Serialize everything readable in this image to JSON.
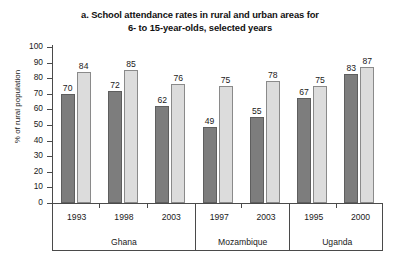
{
  "chart_data": {
    "type": "bar",
    "title": "a. School attendance rates in rural and urban areas for 6- to 15-year-olds, selected years",
    "title_lines": [
      "a. School attendance rates in rural and urban areas for",
      "6- to 15-year-olds, selected years"
    ],
    "xlabel": "",
    "ylabel": "% of rural population",
    "ylim": [
      0,
      100
    ],
    "ytick_step": 10,
    "yticks": [
      100,
      90,
      80,
      70,
      60,
      50,
      40,
      30,
      20,
      10,
      0
    ],
    "grid": false,
    "legend_position": "none",
    "categories": [
      "1993",
      "1998",
      "2003",
      "1997",
      "2003",
      "1995",
      "2000"
    ],
    "groups": [
      {
        "name": "Ghana",
        "years": [
          "1993",
          "1998",
          "2003"
        ],
        "rural": [
          70,
          72,
          62
        ],
        "urban": [
          84,
          85,
          76
        ]
      },
      {
        "name": "Mozambique",
        "years": [
          "1997",
          "2003"
        ],
        "rural": [
          49,
          55
        ],
        "urban": [
          75,
          78
        ]
      },
      {
        "name": "Uganda",
        "years": [
          "1995",
          "2000"
        ],
        "rural": [
          67,
          83
        ],
        "urban": [
          75,
          87
        ]
      }
    ],
    "series": [
      {
        "name": "rural",
        "color": "#7d7d7d",
        "values": [
          70,
          72,
          62,
          49,
          55,
          67,
          83
        ]
      },
      {
        "name": "urban",
        "color": "#dcdcdc",
        "values": [
          84,
          85,
          76,
          75,
          78,
          75,
          87
        ]
      }
    ]
  },
  "footer": {
    "clipped_text": ""
  }
}
